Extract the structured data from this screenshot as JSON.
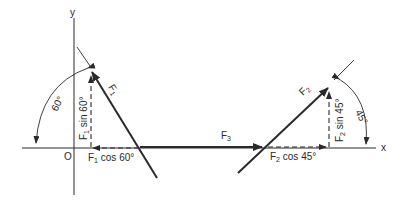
{
  "diagram": {
    "type": "force-component-diagram",
    "axes": {
      "x_label": "x",
      "y_label": "y",
      "origin_label": "O"
    },
    "forces": [
      {
        "name": "F1",
        "label_main": "F",
        "label_sub": "1",
        "angle_deg": 60,
        "angle_label": "60°",
        "component_vertical": {
          "main": "F",
          "sub": "1",
          "rest": " sin 60°"
        },
        "component_horizontal": {
          "main": "F",
          "sub": "1",
          "rest": " cos 60°"
        }
      },
      {
        "name": "F2",
        "label_main": "F",
        "label_sub": "2",
        "angle_deg": 45,
        "angle_label": "45°",
        "component_vertical": {
          "main": "F",
          "sub": "2",
          "rest": " sin 45°"
        },
        "component_horizontal": {
          "main": "F",
          "sub": "2",
          "rest": " cos 45°"
        }
      },
      {
        "name": "F3",
        "label_main": "F",
        "label_sub": "3"
      }
    ],
    "colors": {
      "stroke": "#2a2a2a",
      "background": "#ffffff"
    }
  }
}
